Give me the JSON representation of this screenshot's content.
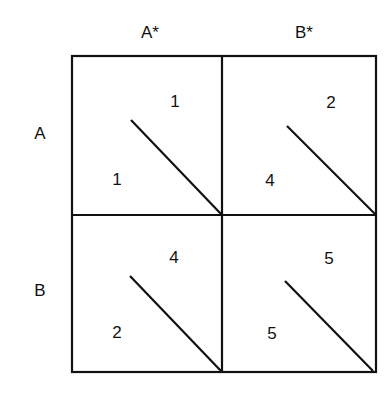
{
  "matrix": {
    "column_headers": [
      "A*",
      "B*"
    ],
    "row_headers": [
      "A",
      "B"
    ],
    "cells": [
      [
        {
          "row_payoff": "1",
          "col_payoff": "1"
        },
        {
          "row_payoff": "4",
          "col_payoff": "2"
        }
      ],
      [
        {
          "row_payoff": "2",
          "col_payoff": "4"
        },
        {
          "row_payoff": "5",
          "col_payoff": "5"
        }
      ]
    ]
  },
  "colors": {
    "line": "#111111",
    "background": "#ffffff"
  }
}
